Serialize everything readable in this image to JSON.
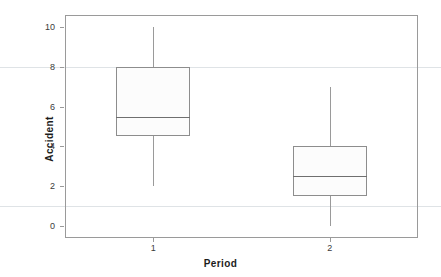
{
  "chart_data": {
    "type": "box",
    "title": "",
    "xlabel": "Period",
    "ylabel": "Accident",
    "categories": [
      "1",
      "2"
    ],
    "x_tick_labels": [
      "1",
      "2"
    ],
    "y_tick_labels": [
      "0",
      "2",
      "4",
      "6",
      "8",
      "10"
    ],
    "y_ticks": [
      0,
      2,
      4,
      6,
      8,
      10
    ],
    "ylim": [
      -0.6,
      10.6
    ],
    "grid": true,
    "gridlines_y": [
      8,
      1
    ],
    "legend": "none",
    "boxes": [
      {
        "category": "1",
        "whisker_low": 2.0,
        "q1": 4.5,
        "median": 5.5,
        "q3": 8.0,
        "whisker_high": 10.0
      },
      {
        "category": "2",
        "whisker_low": 0.0,
        "q1": 1.5,
        "median": 2.5,
        "q3": 4.0,
        "whisker_high": 7.0
      }
    ],
    "colors": {
      "box_fill": "#fcfcfc",
      "box_border": "#8d8d8d",
      "median": "#6f6f6f",
      "whisker": "#9a9a9a",
      "frame": "#9a9a9a",
      "gridline": "#dfe3e6",
      "text": "#1c1c1c"
    }
  }
}
